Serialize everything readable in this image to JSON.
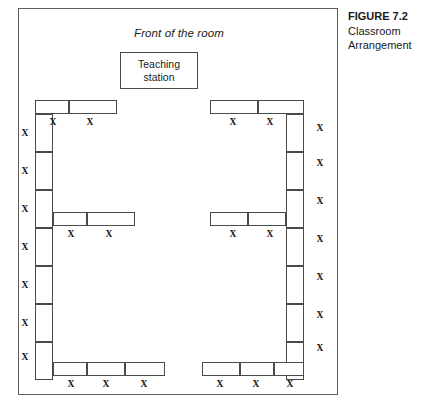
{
  "figure": {
    "caption_title": "FIGURE 7.2",
    "caption_line1": "Classroom",
    "caption_line2": "Arrangement"
  },
  "room": {
    "front_label": "Front of the room",
    "teaching_station": {
      "line1": "Teaching",
      "line2": "station"
    }
  },
  "seat_mark": "X",
  "layout": {
    "frame": {
      "x": 18,
      "y": 8,
      "w": 320,
      "h": 387
    },
    "colors": {
      "line": "#4a4a4a",
      "frame": "#5d5d5d",
      "text": "#111111",
      "background": "#ffffff"
    },
    "desks": [
      {
        "name": "desk-top-left-1",
        "x": 34,
        "y": 99,
        "w": 34,
        "h": 14
      },
      {
        "name": "desk-top-left-2",
        "x": 68,
        "y": 99,
        "w": 48,
        "h": 14
      },
      {
        "name": "desk-top-right-1",
        "x": 209,
        "y": 99,
        "w": 48,
        "h": 14
      },
      {
        "name": "desk-top-right-2",
        "x": 257,
        "y": 99,
        "w": 46,
        "h": 14
      },
      {
        "name": "desk-left-col-1",
        "x": 34,
        "y": 113,
        "w": 18,
        "h": 38
      },
      {
        "name": "desk-left-col-2",
        "x": 34,
        "y": 151,
        "w": 18,
        "h": 38
      },
      {
        "name": "desk-left-col-3",
        "x": 34,
        "y": 189,
        "w": 18,
        "h": 38
      },
      {
        "name": "desk-left-col-4",
        "x": 34,
        "y": 227,
        "w": 18,
        "h": 38
      },
      {
        "name": "desk-left-col-5",
        "x": 34,
        "y": 265,
        "w": 18,
        "h": 38
      },
      {
        "name": "desk-left-col-6",
        "x": 34,
        "y": 303,
        "w": 18,
        "h": 38
      },
      {
        "name": "desk-left-col-7",
        "x": 34,
        "y": 341,
        "w": 18,
        "h": 38
      },
      {
        "name": "desk-right-col-1",
        "x": 285,
        "y": 113,
        "w": 18,
        "h": 38
      },
      {
        "name": "desk-right-col-2",
        "x": 285,
        "y": 151,
        "w": 18,
        "h": 38
      },
      {
        "name": "desk-right-col-3",
        "x": 285,
        "y": 189,
        "w": 18,
        "h": 38
      },
      {
        "name": "desk-right-col-4",
        "x": 285,
        "y": 227,
        "w": 18,
        "h": 38
      },
      {
        "name": "desk-right-col-5",
        "x": 285,
        "y": 265,
        "w": 18,
        "h": 38
      },
      {
        "name": "desk-right-col-6",
        "x": 285,
        "y": 303,
        "w": 18,
        "h": 38
      },
      {
        "name": "desk-right-col-7",
        "x": 285,
        "y": 341,
        "w": 18,
        "h": 38
      },
      {
        "name": "desk-mid-left-1",
        "x": 52,
        "y": 211,
        "w": 34,
        "h": 14
      },
      {
        "name": "desk-mid-left-2",
        "x": 86,
        "y": 211,
        "w": 48,
        "h": 14
      },
      {
        "name": "desk-mid-right-1",
        "x": 209,
        "y": 211,
        "w": 38,
        "h": 14
      },
      {
        "name": "desk-mid-right-2",
        "x": 247,
        "y": 211,
        "w": 38,
        "h": 14
      },
      {
        "name": "desk-bottom-left-1",
        "x": 52,
        "y": 361,
        "w": 34,
        "h": 14
      },
      {
        "name": "desk-bottom-left-2",
        "x": 86,
        "y": 361,
        "w": 38,
        "h": 14
      },
      {
        "name": "desk-bottom-left-3",
        "x": 124,
        "y": 361,
        "w": 40,
        "h": 14
      },
      {
        "name": "desk-bottom-right-1",
        "x": 201,
        "y": 361,
        "w": 38,
        "h": 14
      },
      {
        "name": "desk-bottom-right-2",
        "x": 239,
        "y": 361,
        "w": 34,
        "h": 14
      },
      {
        "name": "desk-bottom-right-3",
        "x": 273,
        "y": 361,
        "w": 30,
        "h": 14
      }
    ],
    "seats": [
      {
        "name": "seat-top-left-1",
        "x": 48,
        "y": 117
      },
      {
        "name": "seat-top-left-2",
        "x": 85,
        "y": 117
      },
      {
        "name": "seat-top-right-1",
        "x": 228,
        "y": 117
      },
      {
        "name": "seat-top-right-2",
        "x": 265,
        "y": 117
      },
      {
        "name": "seat-left-col-1",
        "x": 20,
        "y": 128
      },
      {
        "name": "seat-left-col-2",
        "x": 20,
        "y": 166
      },
      {
        "name": "seat-left-col-3",
        "x": 20,
        "y": 204
      },
      {
        "name": "seat-left-col-4",
        "x": 20,
        "y": 242
      },
      {
        "name": "seat-left-col-5",
        "x": 20,
        "y": 280
      },
      {
        "name": "seat-left-col-6",
        "x": 20,
        "y": 318
      },
      {
        "name": "seat-left-col-7",
        "x": 20,
        "y": 352
      },
      {
        "name": "seat-right-col-1",
        "x": 315,
        "y": 123
      },
      {
        "name": "seat-right-col-2",
        "x": 315,
        "y": 158
      },
      {
        "name": "seat-right-col-3",
        "x": 315,
        "y": 196
      },
      {
        "name": "seat-right-col-4",
        "x": 315,
        "y": 234
      },
      {
        "name": "seat-right-col-5",
        "x": 315,
        "y": 272
      },
      {
        "name": "seat-right-col-6",
        "x": 315,
        "y": 310
      },
      {
        "name": "seat-right-col-7",
        "x": 315,
        "y": 343
      },
      {
        "name": "seat-mid-left-1",
        "x": 66,
        "y": 229
      },
      {
        "name": "seat-mid-left-2",
        "x": 104,
        "y": 229
      },
      {
        "name": "seat-mid-right-1",
        "x": 228,
        "y": 229
      },
      {
        "name": "seat-mid-right-2",
        "x": 265,
        "y": 229
      },
      {
        "name": "seat-bottom-left-1",
        "x": 66,
        "y": 379
      },
      {
        "name": "seat-bottom-left-2",
        "x": 101,
        "y": 379
      },
      {
        "name": "seat-bottom-left-3",
        "x": 139,
        "y": 379
      },
      {
        "name": "seat-bottom-right-1",
        "x": 215,
        "y": 379
      },
      {
        "name": "seat-bottom-right-2",
        "x": 251,
        "y": 379
      },
      {
        "name": "seat-bottom-right-3",
        "x": 285,
        "y": 379
      }
    ]
  }
}
